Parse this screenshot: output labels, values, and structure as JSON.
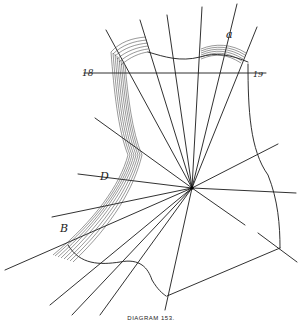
{
  "diagram": {
    "caption": "DIAGRAM 153.",
    "labels": {
      "left_mark": "18",
      "right_mark": "19",
      "top_right": "a",
      "mid_left": "D",
      "lower_left": "B"
    },
    "stroke_color": "#1a1a1a"
  }
}
